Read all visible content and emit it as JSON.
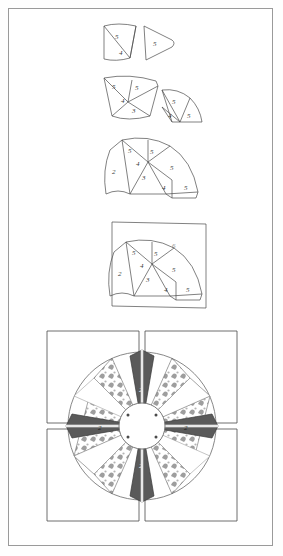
{
  "document": {
    "title": "Mariner's Compass Block Assembly Diagram",
    "type": "quilting instruction illustration",
    "border_color": "#9a9a9a",
    "background_color": "#ffffff"
  },
  "stages": [
    {
      "id": "stage-1",
      "name": "two-small-wedge-units",
      "caption": "",
      "pieces": [
        {
          "name": "left-wedge-unit",
          "labels": [
            "5",
            "4"
          ]
        },
        {
          "name": "right-curved-wedge",
          "labels": [
            "5"
          ]
        }
      ]
    },
    {
      "id": "stage-2",
      "name": "two-joined-wedge-groups",
      "caption": "",
      "pieces": [
        {
          "name": "left-wedge-group",
          "labels": [
            "5",
            "4",
            "5",
            "3"
          ]
        },
        {
          "name": "right-wedge-group",
          "labels": [
            "5",
            "4",
            "5"
          ]
        }
      ]
    },
    {
      "id": "stage-3",
      "name": "full-quarter-fan",
      "caption": "",
      "pieces": [
        {
          "name": "quarter-fan",
          "labels": [
            "5",
            "4",
            "5",
            "2",
            "3",
            "5",
            "4",
            "5"
          ]
        }
      ]
    },
    {
      "id": "stage-4",
      "name": "fan-appliqued-to-background-square",
      "caption": "",
      "pieces": [
        {
          "name": "background-square",
          "labels": [
            "6"
          ]
        },
        {
          "name": "quarter-fan",
          "labels": [
            "5",
            "4",
            "5",
            "2",
            "3",
            "5",
            "4",
            "5"
          ]
        }
      ]
    },
    {
      "id": "stage-5",
      "name": "completed-compass-block",
      "caption": "",
      "pieces": [
        {
          "name": "four-background-squares",
          "labels": []
        },
        {
          "name": "compass-star",
          "labels": [
            "2",
            "2",
            "2",
            "2"
          ]
        },
        {
          "name": "center-circle",
          "labels": []
        }
      ]
    }
  ],
  "piece_numbers": {
    "n2": "2",
    "n3": "3",
    "n4": "4",
    "n5": "5",
    "n6": "6"
  },
  "colors": {
    "outline": "#4a4a4a",
    "light_outline": "#8a8a8a",
    "dark_fabric": "#5a5a5a",
    "print_fabric": "#9e9e9e",
    "background_fabric": "#ffffff",
    "page_border": "#9a9a9a"
  }
}
